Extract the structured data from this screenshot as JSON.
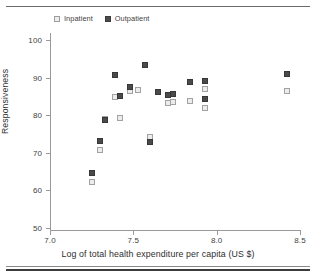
{
  "figure": {
    "legend": {
      "position": "top-left",
      "entries": [
        {
          "label": "Inpatient",
          "marker": "open-square",
          "color": "#ececec"
        },
        {
          "label": "Outpatient",
          "marker": "filled-square",
          "color": "#4a4a4a"
        }
      ]
    }
  },
  "chart_data": {
    "type": "scatter",
    "title": "",
    "xlabel": "Log of total health expenditure per capita (US $)",
    "ylabel": "Responsiveness",
    "xlim": [
      7.0,
      8.5
    ],
    "ylim": [
      50,
      100
    ],
    "xticks": [
      "7.0",
      "7.5",
      "8.0",
      "8.5"
    ],
    "yticks": [
      "50",
      "60",
      "70",
      "80",
      "90",
      "100"
    ],
    "xtick_values": [
      7.0,
      7.5,
      8.0,
      8.5
    ],
    "ytick_values": [
      50,
      60,
      70,
      80,
      90,
      100
    ],
    "grid": false,
    "legend_position": "top-left",
    "series": [
      {
        "name": "Inpatient",
        "marker": "open-square",
        "color": "#ececec",
        "edge_color": "#a2a2a2",
        "points": [
          {
            "x": 7.25,
            "y": 62.2
          },
          {
            "x": 7.3,
            "y": 70.8
          },
          {
            "x": 7.33,
            "y": 79.0
          },
          {
            "x": 7.39,
            "y": 84.9
          },
          {
            "x": 7.42,
            "y": 79.2
          },
          {
            "x": 7.48,
            "y": 86.5
          },
          {
            "x": 7.53,
            "y": 86.8
          },
          {
            "x": 7.6,
            "y": 74.1
          },
          {
            "x": 7.71,
            "y": 83.2
          },
          {
            "x": 7.74,
            "y": 83.4
          },
          {
            "x": 7.84,
            "y": 83.9
          },
          {
            "x": 7.93,
            "y": 87.0
          },
          {
            "x": 7.93,
            "y": 82.0
          },
          {
            "x": 8.42,
            "y": 86.5
          }
        ]
      },
      {
        "name": "Outpatient",
        "marker": "filled-square",
        "color": "#4a4a4a",
        "edge_color": "#373737",
        "points": [
          {
            "x": 7.25,
            "y": 64.6
          },
          {
            "x": 7.3,
            "y": 73.1
          },
          {
            "x": 7.33,
            "y": 78.8
          },
          {
            "x": 7.39,
            "y": 90.7
          },
          {
            "x": 7.42,
            "y": 85.0
          },
          {
            "x": 7.48,
            "y": 87.4
          },
          {
            "x": 7.57,
            "y": 93.3
          },
          {
            "x": 7.6,
            "y": 72.8
          },
          {
            "x": 7.65,
            "y": 86.2
          },
          {
            "x": 7.71,
            "y": 85.5
          },
          {
            "x": 7.74,
            "y": 85.6
          },
          {
            "x": 7.84,
            "y": 88.7
          },
          {
            "x": 7.93,
            "y": 89.1
          },
          {
            "x": 7.93,
            "y": 84.4
          },
          {
            "x": 8.42,
            "y": 90.9
          }
        ]
      }
    ]
  }
}
